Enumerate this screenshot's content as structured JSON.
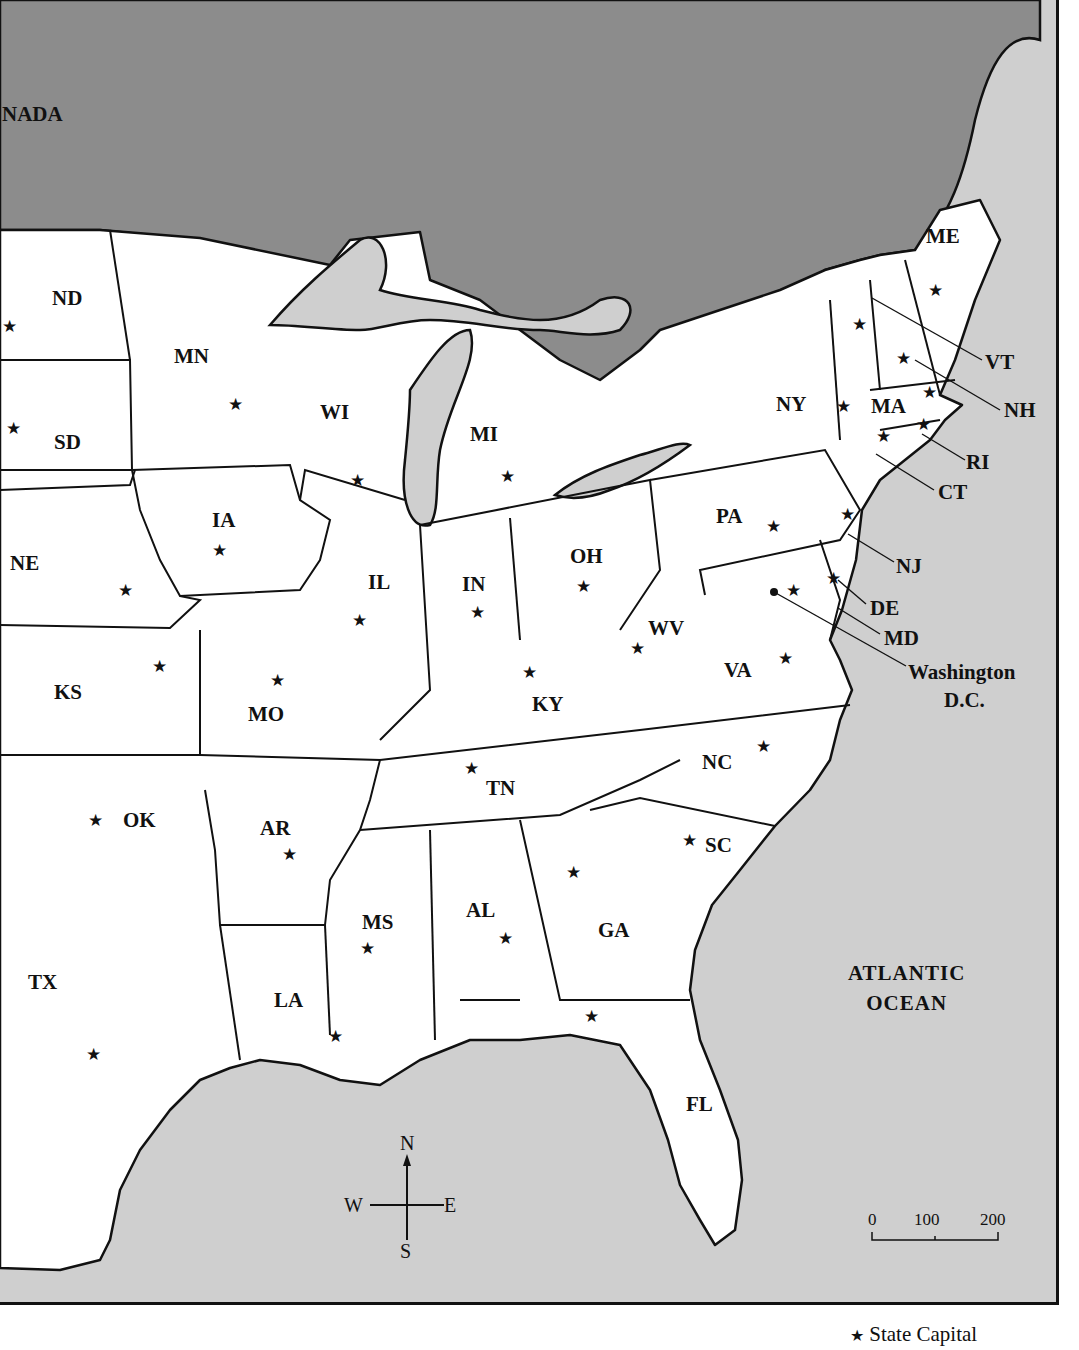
{
  "map": {
    "region_labels": {
      "canada": "NADA",
      "ocean_line1": "ATLANTIC",
      "ocean_line2": "OCEAN"
    },
    "states": [
      {
        "abbr": "ND",
        "x": 52,
        "y": 288
      },
      {
        "abbr": "SD",
        "x": 54,
        "y": 432
      },
      {
        "abbr": "NE",
        "x": 10,
        "y": 553
      },
      {
        "abbr": "KS",
        "x": 54,
        "y": 682
      },
      {
        "abbr": "OK",
        "x": 123,
        "y": 810
      },
      {
        "abbr": "TX",
        "x": 28,
        "y": 972
      },
      {
        "abbr": "MN",
        "x": 174,
        "y": 346
      },
      {
        "abbr": "IA",
        "x": 212,
        "y": 510
      },
      {
        "abbr": "MO",
        "x": 248,
        "y": 704
      },
      {
        "abbr": "AR",
        "x": 260,
        "y": 818
      },
      {
        "abbr": "LA",
        "x": 274,
        "y": 990
      },
      {
        "abbr": "WI",
        "x": 320,
        "y": 402
      },
      {
        "abbr": "IL",
        "x": 368,
        "y": 572
      },
      {
        "abbr": "MS",
        "x": 362,
        "y": 912
      },
      {
        "abbr": "MI",
        "x": 470,
        "y": 424
      },
      {
        "abbr": "IN",
        "x": 462,
        "y": 574
      },
      {
        "abbr": "KY",
        "x": 532,
        "y": 694
      },
      {
        "abbr": "TN",
        "x": 486,
        "y": 778
      },
      {
        "abbr": "AL",
        "x": 466,
        "y": 900
      },
      {
        "abbr": "OH",
        "x": 570,
        "y": 546
      },
      {
        "abbr": "GA",
        "x": 598,
        "y": 920
      },
      {
        "abbr": "FL",
        "x": 686,
        "y": 1094
      },
      {
        "abbr": "WV",
        "x": 648,
        "y": 618
      },
      {
        "abbr": "VA",
        "x": 724,
        "y": 660
      },
      {
        "abbr": "NC",
        "x": 702,
        "y": 752
      },
      {
        "abbr": "SC",
        "x": 705,
        "y": 835
      },
      {
        "abbr": "PA",
        "x": 716,
        "y": 506
      },
      {
        "abbr": "NY",
        "x": 776,
        "y": 394
      },
      {
        "abbr": "ME",
        "x": 926,
        "y": 226
      },
      {
        "abbr": "MA",
        "x": 871,
        "y": 396
      },
      {
        "abbr": "VT",
        "x": 985,
        "y": 352
      },
      {
        "abbr": "NH",
        "x": 1004,
        "y": 400
      },
      {
        "abbr": "RI",
        "x": 966,
        "y": 452
      },
      {
        "abbr": "CT",
        "x": 938,
        "y": 482
      },
      {
        "abbr": "NJ",
        "x": 896,
        "y": 556
      },
      {
        "abbr": "DE",
        "x": 870,
        "y": 598
      },
      {
        "abbr": "MD",
        "x": 884,
        "y": 628
      },
      {
        "abbr": "Washington",
        "x": 908,
        "y": 662
      },
      {
        "abbr": "D.C.",
        "x": 944,
        "y": 690
      }
    ],
    "capital_symbol": "★",
    "capitals": [
      {
        "x": 2,
        "y": 318
      },
      {
        "x": 6,
        "y": 420
      },
      {
        "x": 118,
        "y": 582
      },
      {
        "x": 152,
        "y": 658
      },
      {
        "x": 88,
        "y": 812
      },
      {
        "x": 86,
        "y": 1046
      },
      {
        "x": 228,
        "y": 396
      },
      {
        "x": 212,
        "y": 542
      },
      {
        "x": 270,
        "y": 672
      },
      {
        "x": 282,
        "y": 846
      },
      {
        "x": 328,
        "y": 1028
      },
      {
        "x": 350,
        "y": 472
      },
      {
        "x": 352,
        "y": 612
      },
      {
        "x": 360,
        "y": 940
      },
      {
        "x": 500,
        "y": 468
      },
      {
        "x": 470,
        "y": 604
      },
      {
        "x": 522,
        "y": 664
      },
      {
        "x": 464,
        "y": 760
      },
      {
        "x": 498,
        "y": 930
      },
      {
        "x": 576,
        "y": 578
      },
      {
        "x": 566,
        "y": 864
      },
      {
        "x": 584,
        "y": 1008
      },
      {
        "x": 630,
        "y": 640
      },
      {
        "x": 778,
        "y": 650
      },
      {
        "x": 756,
        "y": 738
      },
      {
        "x": 682,
        "y": 832
      },
      {
        "x": 766,
        "y": 518
      },
      {
        "x": 836,
        "y": 398
      },
      {
        "x": 928,
        "y": 282
      },
      {
        "x": 852,
        "y": 316
      },
      {
        "x": 896,
        "y": 350
      },
      {
        "x": 922,
        "y": 384
      },
      {
        "x": 876,
        "y": 428
      },
      {
        "x": 916,
        "y": 416
      },
      {
        "x": 840,
        "y": 506
      },
      {
        "x": 826,
        "y": 570
      },
      {
        "x": 786,
        "y": 582
      }
    ],
    "compass": {
      "n": "N",
      "s": "S",
      "e": "E",
      "w": "W"
    },
    "scale": {
      "ticks": [
        "0",
        "100",
        "200"
      ]
    },
    "legend": {
      "symbol": "★",
      "label": "State Capital"
    }
  }
}
